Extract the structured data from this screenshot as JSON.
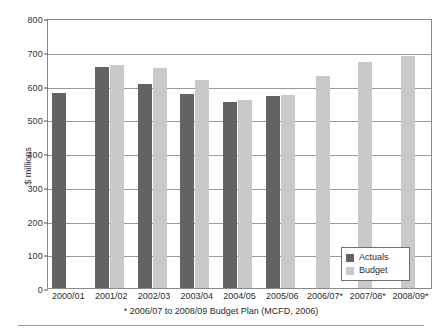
{
  "chart_data": {
    "type": "bar",
    "title": "",
    "xlabel": "",
    "ylabel": "$ millions",
    "ylim": [
      0,
      800
    ],
    "yticks": [
      0,
      100,
      200,
      300,
      400,
      500,
      600,
      700,
      800
    ],
    "grid": true,
    "legend_position": "inside-bottom-right",
    "categories": [
      "2000/01",
      "2001/02",
      "2002/03",
      "2003/04",
      "2004/05",
      "2005/06",
      "2006/07*",
      "2007/08*",
      "2008/09*"
    ],
    "series": [
      {
        "name": "Actuals",
        "color": "#636363",
        "values": [
          578,
          655,
          604,
          576,
          551,
          569,
          null,
          null,
          null
        ]
      },
      {
        "name": "Budget",
        "color": "#c9c9c9",
        "values": [
          null,
          661,
          651,
          615,
          556,
          571,
          628,
          670,
          688
        ]
      }
    ],
    "footnote": "* 2006/07 to 2008/09 Budget Plan (MCFD, 2006)"
  },
  "axes": {
    "y_title": "$ millions",
    "y_tick_labels": [
      "800",
      "700",
      "600",
      "500",
      "400",
      "300",
      "200",
      "100",
      "0"
    ],
    "x_tick_labels": [
      "2000/01",
      "2001/02",
      "2002/03",
      "2003/04",
      "2004/05",
      "2005/06",
      "2006/07*",
      "2007/08*",
      "2008/09*"
    ]
  },
  "legend": {
    "items": [
      {
        "label": "Actuals",
        "color": "#636363"
      },
      {
        "label": "Budget",
        "color": "#c9c9c9"
      }
    ]
  },
  "footnote": "* 2006/07 to 2008/09 Budget Plan (MCFD, 2006)"
}
